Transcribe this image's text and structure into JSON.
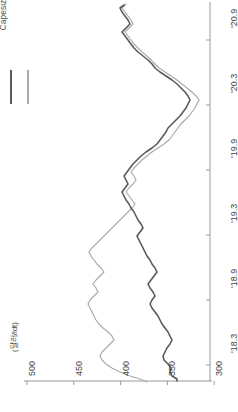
{
  "chart_data": {
    "type": "line",
    "title": "",
    "orientation": "rotated-90",
    "xlabel": "",
    "ylabel": "(달러/ldt)",
    "unit_label": "(달러/ldt)",
    "grid": false,
    "legend_position": "top-left",
    "value_axis": {
      "name": "price",
      "ticks": [
        500,
        450,
        400,
        350,
        300,
        250
      ],
      "tick_labels": [
        "500",
        "450",
        "400",
        "350",
        "300",
        "250"
      ],
      "lim": [
        500,
        250
      ],
      "direction": "decreasing-left-to-right"
    },
    "time_axis": {
      "name": "date",
      "ticks": [
        "'20.9",
        "'20.3",
        "'19.9",
        "'19.3",
        "'18.9",
        "'18.3"
      ],
      "tick_labels": [
        "'20.9",
        "'20.3",
        "'19.9",
        "'19.3",
        "'18.9",
        "'18.3"
      ],
      "lim": [
        "'20.9",
        "'18.3"
      ],
      "direction": "decreasing-top-to-bottom"
    },
    "series": [
      {
        "name": "VLCC",
        "color": "#5a5a5a",
        "x": [
          "'18.3",
          "'18.4",
          "'18.5",
          "'18.6",
          "'18.7",
          "'18.8",
          "'18.9",
          "'18.10",
          "'18.11",
          "'18.12",
          "'19.1",
          "'19.2",
          "'19.3",
          "'19.4",
          "'19.5",
          "'19.6",
          "'19.7",
          "'19.8",
          "'19.9",
          "'19.10",
          "'19.11",
          "'19.12",
          "'20.1",
          "'20.2",
          "'20.3",
          "'20.4",
          "'20.5",
          "'20.6",
          "'20.7",
          "'20.8",
          "'20.9",
          "'20.10",
          "'20.11"
        ],
        "values": [
          428,
          432,
          438,
          440,
          432,
          425,
          428,
          436,
          432,
          428,
          420,
          412,
          415,
          420,
          418,
          412,
          405,
          400,
          398,
          392,
          390,
          388,
          382,
          378,
          372,
          300,
          295,
          310,
          330,
          345,
          360,
          370,
          382
        ]
      },
      {
        "name": "Capesize",
        "color": "#aaaaaa",
        "x": [
          "'18.3",
          "'18.4",
          "'18.5",
          "'18.6",
          "'18.7",
          "'18.8",
          "'18.9",
          "'18.10",
          "'18.11",
          "'18.12",
          "'19.1",
          "'19.2",
          "'19.3",
          "'19.4",
          "'19.5",
          "'19.6",
          "'19.7",
          "'19.8",
          "'19.9",
          "'19.10",
          "'19.11",
          "'19.12",
          "'20.1",
          "'20.2",
          "'20.3",
          "'20.4",
          "'20.5",
          "'20.6",
          "'20.7",
          "'20.8",
          "'20.9",
          "'20.10",
          "'20.11"
        ],
        "values": [
          455,
          460,
          462,
          452,
          445,
          448,
          455,
          462,
          458,
          448,
          438,
          430,
          428,
          432,
          430,
          422,
          415,
          410,
          405,
          398,
          395,
          392,
          388,
          382,
          376,
          305,
          300,
          315,
          335,
          350,
          365,
          375,
          388
        ]
      }
    ],
    "paths": {
      "vlcc": "M 177,381 L 177,379 L 172,376 L 170,372 L 171,368 L 168,364 L 164,360 L 163,356 L 165,352 L 167,348 L 170,344 L 172,340 L 170,336 L 168,332 L 165,328 L 162,324 L 160,320 L 158,316 L 155,312 L 152,308 L 150,304 L 152,300 L 155,296 L 153,292 L 150,288 L 148,284 L 151,280 L 154,276 L 157,272 L 155,268 L 152,264 L 150,260 L 147,256 L 145,252 L 143,248 L 141,244 L 139,240 L 137,236 L 140,232 L 143,228 L 141,224 L 138,220 L 136,216 L 134,212 L 131,208 L 129,204 L 126,200 L 124,196 L 122,192 L 125,188 L 128,184 L 126,180 L 124,176 L 127,172 L 130,168 L 133,164 L 137,160 L 141,156 L 146,152 L 152,148 L 157,144 L 160,140 L 163,136 L 166,132 L 168,128 L 172,124 L 176,120 L 180,116 L 183,112 L 186,108 L 188,104 L 190,100 L 188,96 L 185,92 L 181,88 L 177,84 L 172,80 L 166,76 L 160,72 L 155,68 L 152,64 L 148,60 L 143,56 L 138,52 L 134,48 L 131,44 L 128,40 L 125,36 L 122,32 L 126,28 L 130,24 L 128,20 L 125,16 L 122,12 L 120,8 L 124,5",
      "capesize": "M 147,382 L 140,379 L 130,376 L 120,372 L 112,368 L 106,364 L 102,360 L 100,356 L 102,352 L 106,348 L 110,344 L 114,340 L 112,336 L 108,332 L 103,328 L 99,324 L 96,320 L 94,316 L 92,312 L 90,308 L 88,304 L 90,300 L 94,296 L 98,292 L 96,288 L 93,284 L 96,280 L 100,276 L 104,272 L 101,268 L 97,264 L 94,260 L 91,256 L 89,252 L 92,248 L 96,244 L 100,240 L 104,236 L 108,232 L 112,228 L 116,224 L 120,220 L 124,216 L 128,212 L 132,208 L 135,204 L 132,200 L 129,196 L 126,192 L 129,188 L 133,184 L 136,180 L 134,176 L 131,172 L 134,168 L 138,164 L 142,160 L 147,156 L 152,152 L 158,148 L 164,144 L 169,140 L 172,136 L 175,132 L 178,128 L 181,124 L 185,120 L 189,116 L 192,112 L 195,108 L 197,104 L 199,100 L 196,96 L 192,92 L 187,88 L 182,84 L 177,80 L 171,76 L 165,72 L 159,68 L 155,64 L 151,60 L 147,56 L 142,52 L 138,48 L 134,44 L 131,40 L 128,36 L 125,32 L 129,28 L 133,24 L 131,20 L 128,16 L 125,12 L 122,8 L 126,4"
    }
  },
  "legend": {
    "entries": [
      {
        "label": "VLCC",
        "color": "#5a5a5a"
      },
      {
        "label": "Capesize",
        "color": "#aaaaaa"
      }
    ]
  },
  "axis": {
    "unit_label": "(달러/ldt)",
    "price_labels": [
      "500",
      "450",
      "400",
      "350",
      "300",
      "250"
    ],
    "date_labels": [
      "'20.9",
      "'20.3",
      "'19.9",
      "'19.3",
      "'18.9",
      "'18.3"
    ],
    "axis_color": "#999999"
  }
}
